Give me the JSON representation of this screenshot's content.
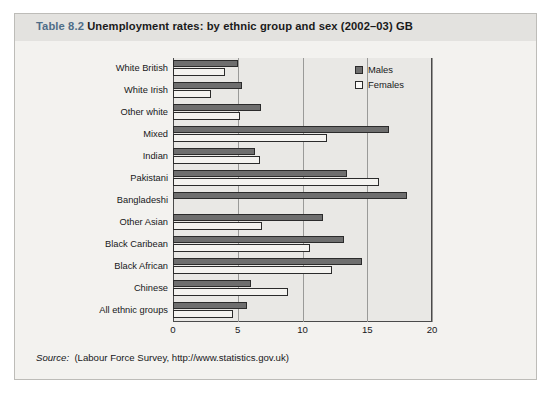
{
  "caption": {
    "table_number": "Table 8.2",
    "title": "Unemployment rates: by ethnic group and sex (2002–03) GB"
  },
  "source": {
    "label": "Source:",
    "text": "(Labour Force Survey, http://www.statistics.gov.uk)"
  },
  "legend": {
    "position": "top-right",
    "items": [
      {
        "label": "Males",
        "color": "#6e6e6e"
      },
      {
        "label": "Females",
        "color": "#fbfaf8"
      }
    ]
  },
  "axis": {
    "x_ticks": [
      "0",
      "5",
      "10",
      "15",
      "20"
    ],
    "x_min": 0,
    "x_max": 20
  },
  "colors": {
    "males_fill": "#6e6e6e",
    "females_fill": "#f4f3f0",
    "bar_stroke": "#2b2b2b",
    "plot_background": "#e9e8e5",
    "page_background": "#f3f2ef",
    "caption_background": "#e3e2df",
    "caption_accent": "#4e6d88",
    "gridline": "#9a9a98",
    "axis": "#4a4a4a"
  },
  "chart_data": {
    "type": "bar",
    "orientation": "horizontal",
    "title": "Unemployment rates: by ethnic group and sex (2002–03) GB",
    "xlabel": "",
    "ylabel": "",
    "xlim": [
      0,
      20
    ],
    "xticks": [
      0,
      5,
      10,
      15,
      20
    ],
    "grid": true,
    "grid_axis": "x",
    "legend": [
      "Males",
      "Females"
    ],
    "legend_position": "top-right",
    "categories": [
      "White British",
      "White Irish",
      "Other white",
      "Mixed",
      "Indian",
      "Pakistani",
      "Bangladeshi",
      "Other Asian",
      "Black Caribean",
      "Black African",
      "Chinese",
      "All ethnic groups"
    ],
    "series": [
      {
        "name": "Males",
        "values": [
          5.0,
          5.3,
          6.8,
          16.7,
          6.3,
          13.4,
          18.1,
          11.6,
          13.2,
          14.6,
          6.0,
          5.7
        ]
      },
      {
        "name": "Females",
        "values": [
          4.0,
          2.9,
          5.2,
          11.9,
          6.7,
          15.9,
          0,
          6.9,
          10.6,
          12.3,
          8.9,
          4.6
        ]
      }
    ]
  }
}
